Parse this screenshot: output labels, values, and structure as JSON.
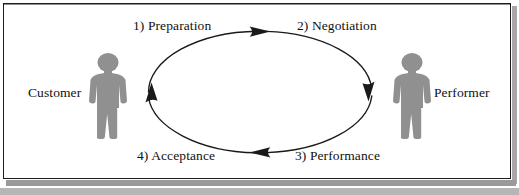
{
  "diagram": {
    "type": "cycle-loop",
    "title": "",
    "background_color": "#ffffff",
    "border_color": "#1c1c1c",
    "figure_color": "#909090",
    "line_color": "#1a1a1a",
    "actors": [
      {
        "id": "customer",
        "label": "Customer",
        "icon": "person-silhouette-icon",
        "side": "left"
      },
      {
        "id": "performer",
        "label": "Performer",
        "icon": "person-silhouette-icon",
        "side": "right"
      }
    ],
    "steps": [
      {
        "number": "1)",
        "label": "1) Preparation",
        "name": "Preparation",
        "position": "top-left",
        "arrow_direction": "right"
      },
      {
        "number": "2)",
        "label": "2) Negotiation",
        "name": "Negotiation",
        "position": "top-right",
        "arrow_direction": "down"
      },
      {
        "number": "3)",
        "label": "3) Performance",
        "name": "Performance",
        "position": "bottom-right",
        "arrow_direction": "left"
      },
      {
        "number": "4)",
        "label": "4) Acceptance",
        "name": "Acceptance",
        "position": "bottom-left",
        "arrow_direction": "up"
      }
    ],
    "loop": {
      "shape": "ellipse",
      "rotation": "clockwise",
      "center_x": 260,
      "center_y": 92,
      "radius_x": 112,
      "radius_y": 61
    }
  }
}
